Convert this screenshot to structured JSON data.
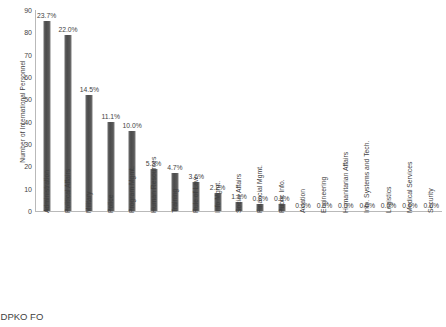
{
  "chart_data": {
    "type": "bar",
    "title": "",
    "subtitle": "",
    "xlabel": "",
    "ylabel": "Number of International Personnel",
    "ylim": [
      0,
      90
    ],
    "y_ticks": [
      0,
      10,
      20,
      30,
      40,
      50,
      60,
      70,
      80,
      90
    ],
    "grid": false,
    "legend": null,
    "bar_color": "#595959",
    "axis_color": "#b9b9b9",
    "categories": [
      "Administration",
      "Political Affairs",
      "Military",
      "Police",
      "Program Mgmt.",
      "Human Resources",
      "Training",
      "Rule of Law",
      "Info Mgmt.",
      "Social Affairs",
      "Financial Mgmt.",
      "Public Info.",
      "Aviation",
      "Engineering",
      "Humanitarian Affairs",
      "Info. Systems and Tech.",
      "Logistics",
      "Medical Services",
      "Security"
    ],
    "values": [
      85,
      79,
      52,
      40,
      36,
      19,
      17,
      13,
      8,
      4,
      3,
      3,
      0,
      0,
      0,
      0,
      0,
      0,
      0
    ],
    "data_labels": [
      "23.7%",
      "22.0%",
      "14.5%",
      "11.1%",
      "10.0%",
      "5.3%",
      "4.7%",
      "3.6%",
      "2.2%",
      "1.1%",
      "0.8%",
      "0.8%",
      "0.0%",
      "0.0%",
      "0.0%",
      "0.0%",
      "0.0%",
      "0.0%",
      "0.0%"
    ]
  },
  "caption": {
    "source_text": "e: DPKO FO"
  }
}
